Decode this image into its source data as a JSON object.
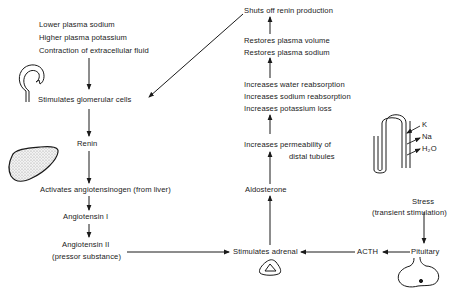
{
  "diagram": {
    "nodes": {
      "triggers": [
        "Lower plasma sodium",
        "Higher plasma potassium",
        "Contraction of extracellular fluid"
      ],
      "glomerular": "Stimulates glomerular cells",
      "renin": "Renin",
      "angiotensinogen": "Activates angiotensinogen (from liver)",
      "ang1": "Angiotensin I",
      "ang2": "Angiotensin II",
      "ang2_note": "(pressor substance)",
      "adrenal": "Stimulates adrenal",
      "acth": "ACTH",
      "pituitary": "Pituitary",
      "stress": "Stress",
      "stress_note": "(transient stimulation)",
      "aldosterone": "Aldosterone",
      "permeability_1": "Increases permeability of",
      "permeability_2": "distal tubules",
      "reabsorption": [
        "Increases water reabsorption",
        "Increases sodium reabsorption",
        "Increases potassium loss"
      ],
      "restores": [
        "Restores plasma volume",
        "Restores plasma sodium"
      ],
      "shutoff": "Shuts off renin production"
    },
    "tubule_labels": {
      "k": "K",
      "na": "Na",
      "h2o": "H₂O"
    },
    "edges": [
      [
        "triggers",
        "glomerular"
      ],
      [
        "glomerular",
        "renin"
      ],
      [
        "renin",
        "angiotensinogen"
      ],
      [
        "angiotensinogen",
        "ang1"
      ],
      [
        "ang1",
        "ang2"
      ],
      [
        "ang2",
        "adrenal"
      ],
      [
        "stress",
        "pituitary"
      ],
      [
        "pituitary",
        "acth"
      ],
      [
        "acth",
        "adrenal"
      ],
      [
        "adrenal",
        "aldosterone"
      ],
      [
        "aldosterone",
        "permeability"
      ],
      [
        "permeability",
        "reabsorption"
      ],
      [
        "reabsorption",
        "restores"
      ],
      [
        "restores",
        "shutoff"
      ],
      [
        "shutoff",
        "glomerular"
      ]
    ],
    "icons": [
      "glomerulus-icon",
      "liver-icon",
      "adrenal-gland-icon",
      "pituitary-gland-icon",
      "kidney-tubule-icon"
    ],
    "colors": {
      "ink": "#1a1a1a",
      "background": "#ffffff",
      "liver_fill": "#d8d8d8"
    }
  }
}
